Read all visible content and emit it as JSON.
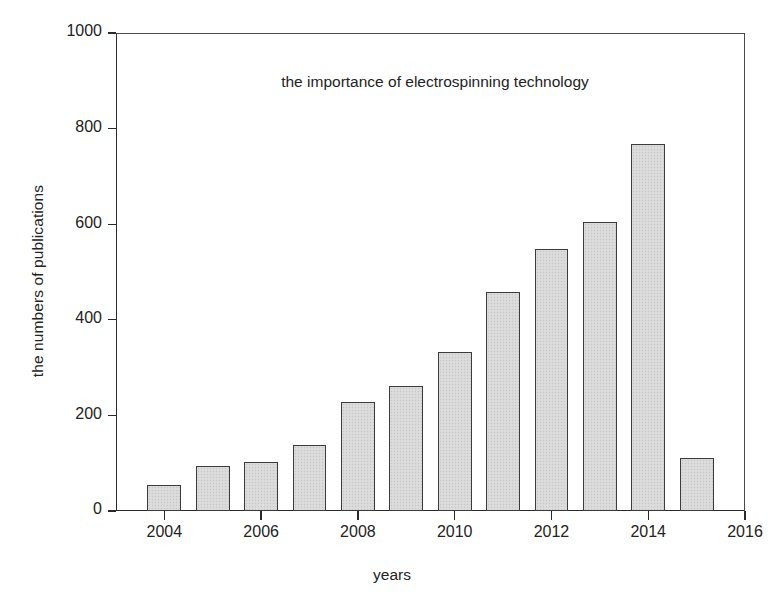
{
  "chart_data": {
    "type": "bar",
    "title": "the importance of electrospinning technology",
    "xlabel": "years",
    "ylabel": "the numbers of publications",
    "categories": [
      2004,
      2005,
      2006,
      2007,
      2008,
      2009,
      2010,
      2011,
      2012,
      2013,
      2014,
      2015
    ],
    "values": [
      54,
      94,
      102,
      138,
      228,
      262,
      333,
      458,
      548,
      605,
      768,
      110
    ],
    "series": [
      {
        "name": "publications",
        "values": [
          54,
          94,
          102,
          138,
          228,
          262,
          333,
          458,
          548,
          605,
          768,
          110
        ]
      }
    ],
    "xlim": [
      2003.0,
      2016.0
    ],
    "ylim": [
      0,
      1000
    ],
    "y_ticks": [
      0,
      200,
      400,
      600,
      800,
      1000
    ],
    "y_tick_labels": [
      "0",
      "200",
      "400",
      "600",
      "800",
      "1000"
    ],
    "x_ticks": [
      2004,
      2006,
      2008,
      2010,
      2012,
      2014,
      2016
    ],
    "x_tick_labels": [
      "2004",
      "2006",
      "2008",
      "2010",
      "2012",
      "2014",
      "2016"
    ],
    "grid": false,
    "legend": false,
    "bar_fill_color": "#d9d9d9",
    "bar_edge_color": "#3b3b3b",
    "axis_color": "#2a2a2a",
    "background_color": "#ffffff"
  }
}
